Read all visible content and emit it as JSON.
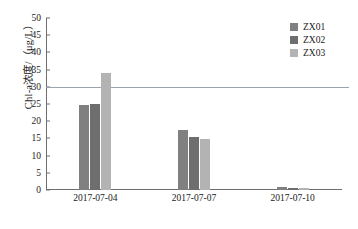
{
  "chart_data": {
    "type": "bar",
    "title": "",
    "xlabel": "",
    "ylabel": "Chl-a浓度/（μg/L）",
    "categories": [
      "2017-07-04",
      "2017-07-07",
      "2017-07-10"
    ],
    "series": [
      {
        "name": "ZX01",
        "color": "#808080",
        "values": [
          24.8,
          17.5,
          0.9
        ]
      },
      {
        "name": "ZX02",
        "color": "#6e6e6e",
        "values": [
          25.0,
          15.4,
          0.7
        ]
      },
      {
        "name": "ZX03",
        "color": "#b3b3b3",
        "values": [
          34.0,
          14.8,
          0.6
        ]
      }
    ],
    "ylim": [
      0,
      50
    ],
    "ytick_step": 5,
    "yticks": [
      "0",
      "5",
      "10",
      "15",
      "20",
      "25",
      "30",
      "35",
      "40",
      "45",
      "50"
    ],
    "grid": false,
    "legend_position": "top-right",
    "reference_line": {
      "value": 30,
      "color": "#9aa3b0"
    }
  }
}
